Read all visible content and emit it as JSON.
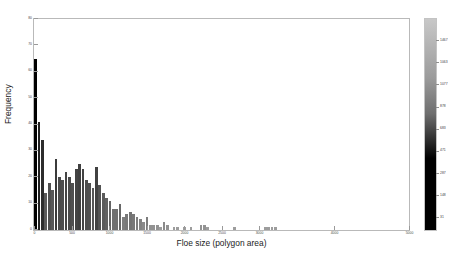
{
  "figure": {
    "background": "#ffffff",
    "axes_color": "#b9b9b9"
  },
  "chart_data": {
    "type": "bar",
    "title": "",
    "subtitle": "",
    "xlabel": "Floe size (polygon area)",
    "ylabel": "Frequency",
    "xlim": [
      0,
      5000
    ],
    "ylim": [
      0,
      80
    ],
    "grid": false,
    "legend": null,
    "xticks": [
      0,
      500,
      1000,
      1500,
      2000,
      2500,
      3000,
      4000,
      5000
    ],
    "xtick_labels": [
      "0",
      "500",
      "1000",
      "1500",
      "2000",
      "2500",
      "3000",
      "4000",
      "5000"
    ],
    "yticks": [
      0,
      10,
      20,
      30,
      40,
      50,
      60,
      70,
      80
    ],
    "ytick_labels": [
      "0",
      "10",
      "20",
      "30",
      "40",
      "50",
      "60",
      "70",
      "80"
    ],
    "bin_width": 45,
    "bar_gap": 2,
    "x": [
      22,
      67,
      112,
      157,
      202,
      247,
      292,
      337,
      382,
      427,
      472,
      517,
      562,
      607,
      652,
      697,
      742,
      787,
      832,
      877,
      922,
      967,
      1012,
      1057,
      1102,
      1147,
      1192,
      1237,
      1282,
      1327,
      1372,
      1417,
      1462,
      1507,
      1552,
      1597,
      1642,
      1687,
      1732,
      1777,
      1822,
      1867,
      1912,
      1957,
      2002,
      2047,
      2092,
      2137,
      2182,
      2227,
      2272,
      2317,
      2362,
      2407,
      2452,
      2497,
      2542,
      2587,
      2632,
      2677,
      2722,
      2767,
      2812,
      2857,
      2902,
      2947,
      2992,
      3037,
      3082,
      3127,
      3172,
      3217,
      3262,
      3307,
      3352,
      3397,
      3442,
      3487,
      3532,
      3577,
      3622,
      3667,
      3712,
      3757,
      3802,
      3847,
      3892,
      3937,
      3982,
      4027,
      4072,
      4117,
      4162,
      4207,
      4252,
      4297,
      4342,
      4387,
      4432,
      4477,
      4522,
      4567,
      4612,
      4657,
      4702,
      4747,
      4792,
      4837,
      4882,
      4927,
      4972
    ],
    "values": [
      65,
      41,
      34,
      14,
      18,
      15,
      27,
      20,
      19,
      22,
      20,
      18,
      23,
      25,
      23,
      19,
      18,
      16,
      24,
      17,
      14,
      12,
      11,
      8,
      8,
      10,
      5,
      6,
      7,
      6,
      5,
      4,
      3,
      5,
      2,
      2,
      2,
      1,
      3,
      2,
      0,
      1,
      1,
      0,
      1,
      0,
      1,
      0,
      0,
      2,
      2,
      1,
      0,
      0,
      0,
      0,
      0,
      0,
      0,
      1,
      0,
      0,
      0,
      0,
      0,
      0,
      0,
      0,
      1,
      1,
      1,
      1,
      0,
      0,
      0,
      0,
      0,
      0,
      0,
      0,
      0,
      0,
      0,
      0,
      0,
      0,
      0,
      0,
      0,
      0,
      0,
      0,
      0,
      0,
      0,
      0,
      0,
      0,
      0,
      0,
      0,
      0,
      0,
      0,
      0,
      0,
      0,
      0,
      0,
      0,
      0
    ],
    "colormap": "grayscale-inverted",
    "note": "bar fill shade encodes count via colorbar; tall/left bars are black, short/right bars are light gray"
  },
  "colorbar": {
    "orientation": "vertical",
    "top_color": "#c8c8c8",
    "bottom_color": "#000000",
    "ticks": [
      {
        "label": "1467",
        "pos": 0.1
      },
      {
        "label": "1063",
        "pos": 0.205
      },
      {
        "label": "1077",
        "pos": 0.31
      },
      {
        "label": "878",
        "pos": 0.415
      },
      {
        "label": "683",
        "pos": 0.52
      },
      {
        "label": "471",
        "pos": 0.625
      },
      {
        "label": "287",
        "pos": 0.73
      },
      {
        "label": "148",
        "pos": 0.835
      },
      {
        "label": "31",
        "pos": 0.94
      }
    ]
  }
}
